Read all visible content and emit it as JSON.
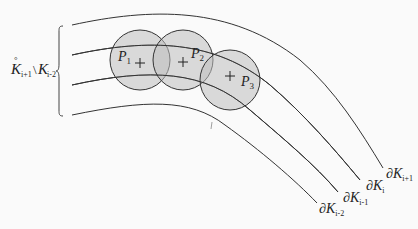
{
  "diagram": {
    "region_label": {
      "main": "K",
      "accent": "°",
      "sub1": "i+1",
      "setminus": "\\",
      "main2": "K",
      "sub2": "i-2"
    },
    "disks": [
      {
        "name": "P",
        "sub": "1"
      },
      {
        "name": "P",
        "sub": "2"
      },
      {
        "name": "P",
        "sub": "3"
      }
    ],
    "boundaries": [
      {
        "prefix": "∂K",
        "sub": "i+1"
      },
      {
        "prefix": "∂K",
        "sub": "i"
      },
      {
        "prefix": "∂K",
        "sub": "i-1"
      },
      {
        "prefix": "∂K",
        "sub": "i-2"
      }
    ],
    "colors": {
      "disk_fill": "#c8c8c8",
      "line": "#333333",
      "background": "#fafafa"
    }
  }
}
